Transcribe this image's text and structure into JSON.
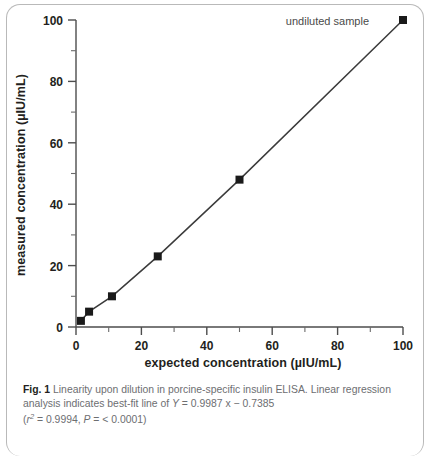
{
  "figure": {
    "label": "Fig. 1",
    "caption_text": " Linearity upon dilution in porcine-specific insulin ELISA. Linear regression analysis indicates best-fit line of ",
    "equation_y": "Y",
    "equation_rest": " = 0.9987 x − 0.7385",
    "stats_open": "(",
    "stats_r": "r",
    "stats_r_sup": "2",
    "stats_r_value": " = 0.9994, ",
    "stats_p": "P",
    "stats_p_value": " = < 0.0001)"
  },
  "chart_data": {
    "type": "scatter",
    "title": "",
    "xlabel": "expected concentration (µIU/mL)",
    "ylabel": "measured concentration (µIU/mL)",
    "xlim": [
      0,
      100
    ],
    "ylim": [
      0,
      100
    ],
    "xticks": [
      0,
      20,
      40,
      60,
      80,
      100
    ],
    "yticks": [
      0,
      20,
      40,
      60,
      80,
      100
    ],
    "xtick_labels": [
      "0",
      "20",
      "40",
      "60",
      "80",
      "100"
    ],
    "ytick_labels": [
      "0",
      "20",
      "40",
      "60",
      "80",
      "100"
    ],
    "minor_tick_interval": 10,
    "grid": false,
    "legend": false,
    "marker": "square",
    "marker_color": "#1a1a1a",
    "line_color": "#3b3b3b",
    "series": [
      {
        "name": "measured vs expected",
        "x": [
          1.5,
          4,
          11,
          25,
          50,
          100
        ],
        "y": [
          2,
          5,
          10,
          23,
          48,
          100
        ]
      }
    ],
    "fit_line": {
      "slope": 0.9987,
      "intercept": -0.7385,
      "r_squared": 0.9994,
      "p_value": "< 0.0001"
    },
    "annotations": [
      {
        "text": "undiluted sample",
        "target_x": 100,
        "target_y": 100
      }
    ]
  }
}
